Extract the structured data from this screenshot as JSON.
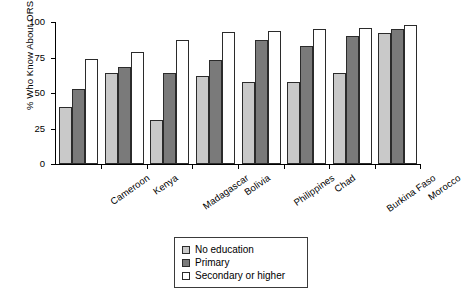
{
  "chart_data": {
    "type": "bar",
    "title": "",
    "xlabel": "",
    "ylabel": "% Who Know About ORS",
    "ylim": [
      0,
      100
    ],
    "yticks": [
      0,
      25,
      50,
      75,
      100
    ],
    "ytick_labels": [
      "0",
      "25",
      "50",
      "75",
      "100"
    ],
    "grid": false,
    "legend_position": "bottom-center",
    "categories": [
      "Cameroon",
      "Kenya",
      "Madagascar",
      "Bolivia",
      "Philippines",
      "Chad",
      "Burkina Faso",
      "Morocco"
    ],
    "series": [
      {
        "name": "No education",
        "color": "#c9c9c9",
        "values": [
          40,
          64,
          31,
          62,
          58,
          58,
          64,
          92
        ]
      },
      {
        "name": "Primary",
        "color": "#7a7a7a",
        "values": [
          53,
          68,
          64,
          73,
          87,
          83,
          90,
          95
        ]
      },
      {
        "name": "Secondary or higher",
        "color": "#ffffff",
        "values": [
          74,
          79,
          87,
          93,
          94,
          95,
          96,
          98
        ]
      }
    ]
  },
  "axis": {
    "y_title": "% Who Know About ORS"
  },
  "legend": {
    "items": [
      {
        "label": "No education"
      },
      {
        "label": "Primary"
      },
      {
        "label": "Secondary or higher"
      }
    ]
  }
}
